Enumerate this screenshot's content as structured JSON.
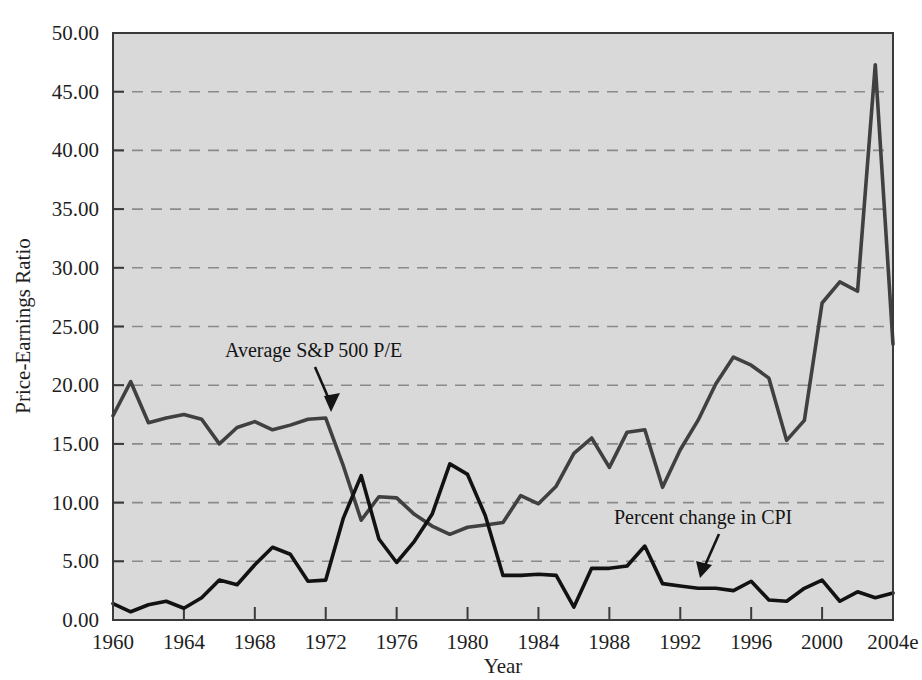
{
  "figure": {
    "background_color": "#ffffff",
    "plot_background_color": "#d9d9d9",
    "frame_color": "#3a3a3a",
    "grid_color": "#8a8a8a"
  },
  "chart_data": {
    "type": "line",
    "title": "",
    "subtitle": "",
    "xlabel": "Year",
    "ylabel": "Price-Earnings Ratio",
    "xlim": [
      1960,
      2004
    ],
    "ylim": [
      0.0,
      50.0
    ],
    "grid": true,
    "grid_axis": "y",
    "legend_position": "inline-annotations",
    "x_tick_labels": [
      "1960",
      "1964",
      "1968",
      "1972",
      "1976",
      "1980",
      "1984",
      "1988",
      "1992",
      "1996",
      "2000",
      "2004e"
    ],
    "x_tick_values": [
      1960,
      1964,
      1968,
      1972,
      1976,
      1980,
      1984,
      1988,
      1992,
      1996,
      2000,
      2004
    ],
    "y_tick_labels": [
      "0.00",
      "5.00",
      "10.00",
      "15.00",
      "20.00",
      "25.00",
      "30.00",
      "35.00",
      "40.00",
      "45.00",
      "50.00"
    ],
    "y_tick_values": [
      0,
      5,
      10,
      15,
      20,
      25,
      30,
      35,
      40,
      45,
      50
    ],
    "x": [
      1960,
      1961,
      1962,
      1963,
      1964,
      1965,
      1966,
      1967,
      1968,
      1969,
      1970,
      1971,
      1972,
      1973,
      1974,
      1975,
      1976,
      1977,
      1978,
      1979,
      1980,
      1981,
      1982,
      1983,
      1984,
      1985,
      1986,
      1987,
      1988,
      1989,
      1990,
      1991,
      1992,
      1993,
      1994,
      1995,
      1996,
      1997,
      1998,
      1999,
      2000,
      2001,
      2002,
      2003,
      2004
    ],
    "series": [
      {
        "name": "Average S&P 500 P/E",
        "color": "#404040",
        "values": [
          17.4,
          20.3,
          16.8,
          17.2,
          17.5,
          17.1,
          15.0,
          16.4,
          16.9,
          16.2,
          16.6,
          17.1,
          17.2,
          13.1,
          8.5,
          10.5,
          10.4,
          9.0,
          8.0,
          7.3,
          7.9,
          8.1,
          8.3,
          10.6,
          9.9,
          11.4,
          14.2,
          15.5,
          13.0,
          16.0,
          16.2,
          11.3,
          14.5,
          17.0,
          20.1,
          22.4,
          21.7,
          20.6,
          15.3,
          17.0,
          27.0,
          28.8,
          28.0,
          47.3,
          23.5
        ]
      },
      {
        "name": "Percent change in CPI",
        "color": "#121212",
        "values": [
          1.4,
          0.7,
          1.3,
          1.6,
          1.0,
          1.9,
          3.4,
          3.0,
          4.7,
          6.2,
          5.6,
          3.3,
          3.4,
          8.7,
          12.3,
          6.9,
          4.9,
          6.7,
          9.0,
          13.3,
          12.4,
          8.9,
          3.8,
          3.8,
          3.9,
          3.8,
          1.1,
          4.4,
          4.4,
          4.6,
          6.3,
          3.1,
          2.9,
          2.7,
          2.7,
          2.5,
          3.3,
          1.7,
          1.6,
          2.7,
          3.4,
          1.6,
          2.4,
          1.9,
          2.3
        ]
      }
    ],
    "annotations": [
      {
        "id": "annotation-sp500",
        "text": "Average S&P 500 P/E",
        "target_x": 1972.6,
        "target_y": 17.2
      },
      {
        "id": "annotation-cpi",
        "text": "Percent change in CPI",
        "target_x": 1994.0,
        "target_y": 2.7
      }
    ]
  }
}
